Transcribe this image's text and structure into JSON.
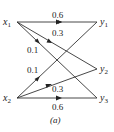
{
  "diagram": {
    "caption": "(a)",
    "nodes": [
      {
        "id": "x1",
        "base": "x",
        "sub": "1",
        "x": 16,
        "y": 22
      },
      {
        "id": "x2",
        "base": "x",
        "sub": "2",
        "x": 16,
        "y": 98
      },
      {
        "id": "y1",
        "base": "y",
        "sub": "1",
        "x": 98,
        "y": 22
      },
      {
        "id": "y2",
        "base": "y",
        "sub": "2",
        "x": 98,
        "y": 69
      },
      {
        "id": "y3",
        "base": "y",
        "sub": "3",
        "x": 98,
        "y": 98
      }
    ],
    "edges": [
      {
        "from": "x1",
        "to": "y1",
        "weight": "0.6"
      },
      {
        "from": "x1",
        "to": "y2",
        "weight": "0.3"
      },
      {
        "from": "x1",
        "to": "y3",
        "weight": "0.1"
      },
      {
        "from": "x2",
        "to": "y1",
        "weight": "0.1"
      },
      {
        "from": "x2",
        "to": "y2",
        "weight": "0.3"
      },
      {
        "from": "x2",
        "to": "y3",
        "weight": "0.6"
      }
    ],
    "line_color": "#333333"
  }
}
